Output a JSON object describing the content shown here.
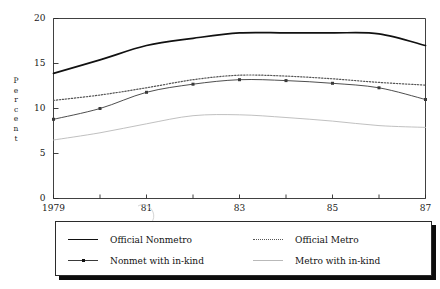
{
  "chart_data": {
    "type": "line",
    "title": "",
    "xlabel": "",
    "ylabel": "Percent",
    "xlim": [
      1979,
      1987
    ],
    "ylim": [
      0,
      20
    ],
    "grid": false,
    "legend_position": "bottom",
    "x": [
      1979,
      1980,
      1981,
      1982,
      1983,
      1984,
      1985,
      1986,
      1987
    ],
    "xtick_values": [
      1979,
      1980,
      1981,
      1982,
      1983,
      1984,
      1985,
      1986,
      1987
    ],
    "xtick_labels": [
      "1979",
      "",
      "81",
      "",
      "83",
      "",
      "85",
      "",
      "87"
    ],
    "ytick_values": [
      0,
      5,
      10,
      15,
      20
    ],
    "ytick_labels": [
      "0",
      "5",
      "10",
      "15",
      "20"
    ],
    "series": [
      {
        "name": "Official Nonmetro",
        "style": "solid-thick",
        "color": "#111111",
        "markers": false,
        "values": [
          13.9,
          15.4,
          17.0,
          17.8,
          18.4,
          18.4,
          18.4,
          18.3,
          17.0
        ]
      },
      {
        "name": "Official Metro",
        "style": "dotted",
        "color": "#555555",
        "markers": false,
        "values": [
          10.9,
          11.5,
          12.3,
          13.2,
          13.7,
          13.6,
          13.3,
          12.9,
          12.6
        ]
      },
      {
        "name": "Nonmet with in-kind",
        "style": "solid-thin-markers",
        "color": "#3a3a3a",
        "markers": true,
        "values": [
          8.8,
          10.0,
          11.8,
          12.7,
          13.2,
          13.1,
          12.8,
          12.3,
          11.0
        ]
      },
      {
        "name": "Metro with in-kind",
        "style": "solid-light",
        "color": "#b9b9b9",
        "markers": false,
        "values": [
          6.5,
          7.3,
          8.3,
          9.2,
          9.3,
          9.0,
          8.6,
          8.1,
          7.9
        ]
      }
    ]
  },
  "legend": {
    "entries": [
      {
        "label": "Official Nonmetro",
        "key": "solid-thick"
      },
      {
        "label": "Official Metro",
        "key": "dotted"
      },
      {
        "label": "Nonmet with in-kind",
        "key": "solid-thin-markers"
      },
      {
        "label": "Metro with in-kind",
        "key": "solid-light"
      }
    ]
  },
  "axis": {
    "y_label_letters": [
      "P",
      "e",
      "r",
      "c",
      "e",
      "n",
      "t"
    ]
  },
  "colors": {
    "axis": "#2b2b2b",
    "series_dark": "#111111",
    "series_dotted": "#555555",
    "series_thin": "#3a3a3a",
    "series_light": "#b9b9b9",
    "legend_shadow": "#0d0d0d",
    "background": "#ffffff"
  }
}
